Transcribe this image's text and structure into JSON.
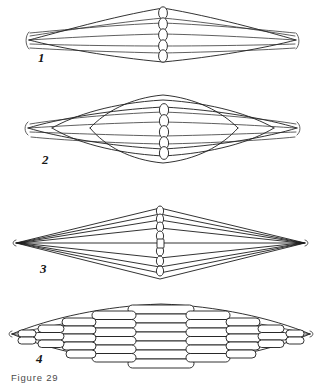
{
  "document": {
    "caption": "Figure 29",
    "background_color": "#ffffff",
    "ink_color": "#1c1c1c"
  },
  "figures": [
    {
      "id": "figure-panel-1",
      "label": "1",
      "description": "elongated low spindle with five longitudinal lines and a central vertical chain of rings",
      "label_x": 38,
      "label_y": 62,
      "ring_count": 5
    },
    {
      "id": "figure-panel-2",
      "label": "2",
      "description": "broad lens-shaped body with curved dorsal and ventral arcs and a central vertical chain of rings",
      "label_x": 42,
      "label_y": 163,
      "ring_count": 5
    },
    {
      "id": "figure-panel-3",
      "label": "3",
      "description": "nested rhombic diamond outlines tapering to sharp lateral tips with a central vertical chain of rings",
      "label_x": 40,
      "label_y": 272,
      "ring_count": 7
    },
    {
      "id": "figure-panel-4",
      "label": "4",
      "description": "lens built from a grid of stacked capsule segments arranged in columns",
      "label_x": 36,
      "label_y": 362,
      "columns": 9,
      "rows": 8
    }
  ]
}
